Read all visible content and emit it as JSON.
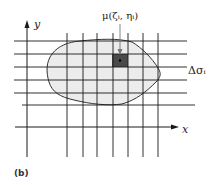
{
  "figure": {
    "panel_label": "(b)",
    "axis_x_label": "x",
    "axis_y_label": "y",
    "point_label": "μ(ζᵢ, ηᵢ)",
    "element_label": "Δσᵢ",
    "colors": {
      "region_fill": "#ececec",
      "region_stroke": "#333333",
      "highlight_cell": "#4a4a4a",
      "lines": "#1a1a1a"
    },
    "grid": {
      "horizontal_y": [
        41,
        54,
        67,
        80,
        93,
        105
      ],
      "vertical_x": [
        67,
        83,
        97,
        113,
        128,
        143,
        158
      ],
      "highlighted_cell": {
        "x": 112,
        "y": 54,
        "width": 16,
        "height": 13
      }
    }
  }
}
